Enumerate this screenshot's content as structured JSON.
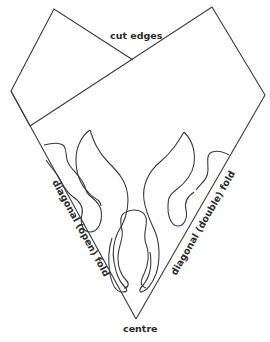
{
  "diagram": {
    "title": "",
    "labels": {
      "top": "cut edges",
      "left_fold": "diagonal (open) fold",
      "right_fold": "diagonal (double) fold",
      "bottom": "centre"
    },
    "colors": {
      "stroke": "#3a3a3a",
      "text": "#2a2a2a",
      "background": "#ffffff"
    }
  }
}
